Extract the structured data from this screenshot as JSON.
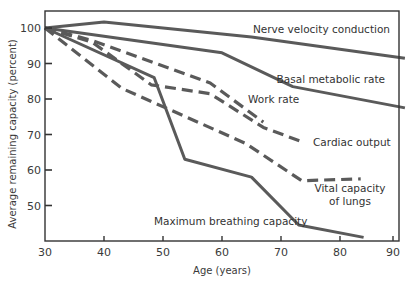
{
  "chart_data": {
    "type": "line",
    "title": "",
    "xlabel": "Age (years)",
    "ylabel": "Average remaining capacity (percent)",
    "xlim": [
      30,
      91
    ],
    "ylim": [
      40,
      105
    ],
    "x_ticks": [
      30,
      40,
      50,
      60,
      70,
      80,
      90
    ],
    "y_ticks": [
      50,
      60,
      70,
      80,
      90,
      100
    ],
    "grid": false,
    "legend": "inline labels",
    "series": [
      {
        "name": "Nerve velocity conduction",
        "style": "solid",
        "points": [
          [
            30,
            100
          ],
          [
            40,
            101.7
          ],
          [
            65,
            97.5
          ],
          [
            91,
            91.5
          ]
        ],
        "label_lines": [
          "Nerve velocity conduction"
        ],
        "label_pos": [
          390,
          33
        ],
        "label_anchor": "end"
      },
      {
        "name": "Basal metabolic rate",
        "style": "solid",
        "points": [
          [
            30,
            100
          ],
          [
            60,
            93
          ],
          [
            72,
            83.5
          ],
          [
            91,
            77.5
          ]
        ],
        "label_lines": [
          "Basal metabolic rate"
        ],
        "label_pos": [
          385,
          83
        ],
        "label_anchor": "end"
      },
      {
        "name": "Work rate",
        "style": "dashed",
        "points": [
          [
            30,
            100
          ],
          [
            38,
            96.5
          ],
          [
            58,
            84.5
          ],
          [
            67,
            73.5
          ]
        ],
        "label_lines": [
          "Work rate"
        ],
        "label_pos": [
          248,
          103
        ],
        "label_anchor": "start"
      },
      {
        "name": "Cardiac output",
        "style": "dashed",
        "points": [
          [
            30,
            100
          ],
          [
            38,
            96
          ],
          [
            48,
            84
          ],
          [
            58,
            81.5
          ],
          [
            67,
            72
          ],
          [
            73.5,
            68
          ]
        ],
        "label_lines": [
          "Cardiac output"
        ],
        "label_pos": [
          313,
          146
        ],
        "label_anchor": "start"
      },
      {
        "name": "Vital capacity of lungs",
        "style": "dashed",
        "points": [
          [
            30,
            100
          ],
          [
            43,
            83
          ],
          [
            64,
            67.5
          ],
          [
            73.5,
            57
          ],
          [
            83.5,
            57.5
          ]
        ],
        "label_lines": [
          "Vital capacity",
          "of lungs"
        ],
        "label_pos": [
          350,
          192
        ],
        "label_anchor": "middle"
      },
      {
        "name": "Maximum breathing capacity",
        "style": "solid",
        "points": [
          [
            30,
            100
          ],
          [
            48.5,
            86
          ],
          [
            53.7,
            63
          ],
          [
            65,
            58
          ],
          [
            73,
            44.5
          ],
          [
            84,
            41
          ]
        ],
        "label_lines": [
          "Maximum breathing capacity"
        ],
        "label_pos": [
          154,
          225
        ],
        "label_anchor": "start"
      }
    ]
  },
  "colors": {
    "line": "#5a5a5a",
    "axis": "#333333",
    "text": "#3a3a3a",
    "background": "#ffffff"
  }
}
